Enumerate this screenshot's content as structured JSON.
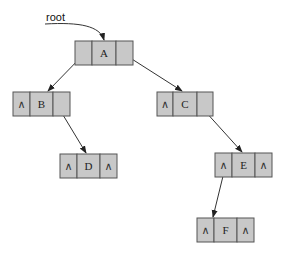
{
  "diagram": {
    "type": "binary-tree-linked-representation",
    "root_label": "root",
    "null_symbol": "∧",
    "colors": {
      "cell_fill": "#c8c8c8",
      "cell_stroke": "#555555",
      "edge": "#333333"
    },
    "nodes": [
      {
        "id": "A",
        "label": "A",
        "left": "B",
        "right": "C"
      },
      {
        "id": "B",
        "label": "B",
        "left": "∧",
        "right": "D"
      },
      {
        "id": "C",
        "label": "C",
        "left": "∧",
        "right": "E"
      },
      {
        "id": "D",
        "label": "D",
        "left": "∧",
        "right": "∧"
      },
      {
        "id": "E",
        "label": "E",
        "left": "F",
        "right": "∧"
      },
      {
        "id": "F",
        "label": "F",
        "left": "∧",
        "right": "∧"
      }
    ],
    "edges": [
      {
        "from": "root",
        "to": "A"
      },
      {
        "from": "A",
        "to": "B",
        "side": "left"
      },
      {
        "from": "A",
        "to": "C",
        "side": "right"
      },
      {
        "from": "B",
        "to": "D",
        "side": "right"
      },
      {
        "from": "C",
        "to": "E",
        "side": "right"
      },
      {
        "from": "E",
        "to": "F",
        "side": "left"
      }
    ],
    "labels": {
      "root": "root",
      "A": "A",
      "B": "B",
      "C": "C",
      "D": "D",
      "E": "E",
      "F": "F",
      "nil": "∧"
    }
  }
}
